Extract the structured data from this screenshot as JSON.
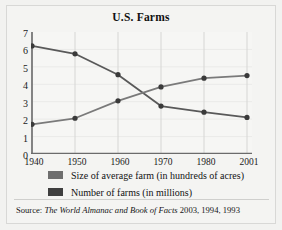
{
  "chart_data": {
    "type": "line",
    "title": "U.S. Farms",
    "xlabel": "",
    "ylabel": "",
    "x": [
      "1940",
      "1950",
      "1960",
      "1970",
      "1980",
      "2001"
    ],
    "categories": [
      "1940",
      "1950",
      "1960",
      "1970",
      "1980",
      "2001"
    ],
    "yticks": [
      "0",
      "1",
      "2",
      "3",
      "4",
      "5",
      "6",
      "7"
    ],
    "ylim": [
      0,
      7
    ],
    "grid": "vertical",
    "legend_position": "below-plot",
    "series": [
      {
        "name": "Number of farms (in millions)",
        "color": "#595959",
        "values": [
          6.2,
          5.75,
          4.55,
          2.75,
          2.4,
          2.1
        ]
      },
      {
        "name": "Size of average farm (in hundreds of acres)",
        "color": "#7a7a7a",
        "values": [
          1.7,
          2.05,
          3.05,
          3.85,
          4.35,
          4.5
        ]
      }
    ],
    "annotations": []
  },
  "title": "U.S. Farms",
  "axes": {
    "y_ticks": [
      "7",
      "6",
      "5",
      "4",
      "3",
      "2",
      "1",
      "0"
    ],
    "x_ticks": [
      "1940",
      "1950",
      "1960",
      "1970",
      "1980",
      "2001"
    ]
  },
  "legend": {
    "items": [
      {
        "label": "Size of average farm (in hundreds of acres)",
        "swatch_color": "#6e6e6e"
      },
      {
        "label": "Number of farms (in millions)",
        "swatch_color": "#3f3f3f"
      }
    ]
  },
  "source": {
    "label": "Source:",
    "title": "The World Almanac and Book of Facts",
    "years": "2003, 1994, 1993"
  },
  "colors": {
    "background": "#f2f2f0",
    "plot_background": "#f6f6f4",
    "axis": "#6b6b6b",
    "gridline": "#d6d6d4",
    "line_farms": "#5a5a5a",
    "line_size": "#7c7c7c",
    "marker": "#3a3a3a"
  }
}
